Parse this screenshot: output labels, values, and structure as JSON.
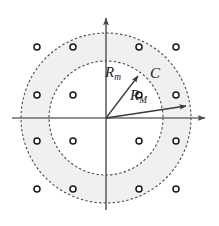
{
  "figure": {
    "background_color": "#ffffff",
    "annulus_fill_color": "#f0f0f0",
    "stroke_color": "#3a3a3a",
    "marker_stroke_color": "#1a1a1a",
    "label_color": "#1a1a1a"
  },
  "axes": {
    "origin": {
      "x": 106,
      "y": 118
    },
    "horizontal": {
      "name": "x-axis",
      "x_start": 12,
      "x_end": 211,
      "y": 118,
      "arrow_at": "right"
    },
    "vertical": {
      "name": "y-axis",
      "y_start": 210,
      "y_end": 12,
      "x": 106,
      "arrow_at": "top"
    }
  },
  "circles": [
    {
      "name": "outer-circle",
      "label": "R_M",
      "cx": 106,
      "cy": 118,
      "radius": 85,
      "style": "dashed"
    },
    {
      "name": "inner-circle",
      "label": "R_m",
      "cx": 106,
      "cy": 118,
      "radius": 57,
      "style": "dashed"
    }
  ],
  "vectors": [
    {
      "name": "inner-radius-vector",
      "label": "R_m",
      "from": {
        "x": 106,
        "y": 118
      },
      "to": {
        "x": 141,
        "y": 72
      }
    },
    {
      "name": "outer-radius-vector",
      "label": "R_M",
      "from": {
        "x": 106,
        "y": 118
      },
      "to": {
        "x": 191,
        "y": 105
      }
    }
  ],
  "labels": {
    "inner_radius": {
      "base": "R",
      "sub": "m"
    },
    "outer_radius": {
      "base": "R",
      "sub": "M"
    },
    "region": {
      "base": "C",
      "sub": ""
    }
  },
  "lattice": {
    "marker_shape": "open-circle",
    "marker_radius": 3,
    "columns_x": [
      37,
      73,
      139,
      176
    ],
    "rows_y": [
      47,
      95,
      141,
      189
    ],
    "count": 16,
    "points": [
      {
        "x": 37,
        "y": 47
      },
      {
        "x": 73,
        "y": 47
      },
      {
        "x": 139,
        "y": 47
      },
      {
        "x": 176,
        "y": 47
      },
      {
        "x": 37,
        "y": 95
      },
      {
        "x": 73,
        "y": 95
      },
      {
        "x": 139,
        "y": 95
      },
      {
        "x": 176,
        "y": 95
      },
      {
        "x": 37,
        "y": 141
      },
      {
        "x": 73,
        "y": 141
      },
      {
        "x": 139,
        "y": 141
      },
      {
        "x": 176,
        "y": 141
      },
      {
        "x": 37,
        "y": 189
      },
      {
        "x": 73,
        "y": 189
      },
      {
        "x": 139,
        "y": 189
      },
      {
        "x": 176,
        "y": 189
      }
    ]
  }
}
